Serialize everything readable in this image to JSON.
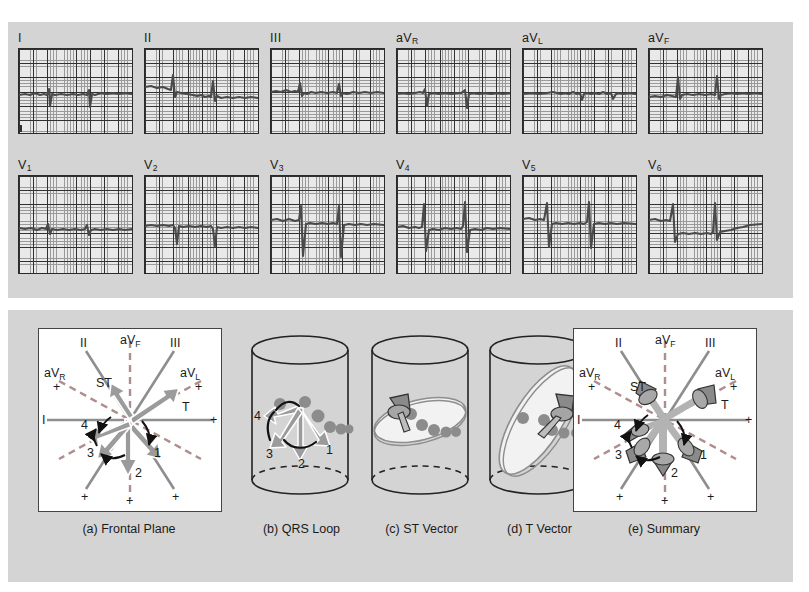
{
  "figure": {
    "background_color": "#d4d4d4",
    "page_color": "#ffffff",
    "trace_color": "#4a4a4a",
    "arrow_fill": "#9b9b9b",
    "grid_fine_color": "#9a9a9a",
    "grid_bold_color": "#313131"
  },
  "ecg": {
    "row1": [
      {
        "name": "I",
        "sub": ""
      },
      {
        "name": "II",
        "sub": ""
      },
      {
        "name": "III",
        "sub": ""
      },
      {
        "name": "aV",
        "sub": "R"
      },
      {
        "name": "aV",
        "sub": "L"
      },
      {
        "name": "aV",
        "sub": "F"
      }
    ],
    "row2": [
      {
        "name": "V",
        "sub": "1"
      },
      {
        "name": "V",
        "sub": "2"
      },
      {
        "name": "V",
        "sub": "3"
      },
      {
        "name": "V",
        "sub": "4"
      },
      {
        "name": "V",
        "sub": "5"
      },
      {
        "name": "V",
        "sub": "6"
      }
    ]
  },
  "vector": {
    "panels": [
      {
        "caption": "(a) Frontal Plane"
      },
      {
        "caption": "(b) QRS Loop"
      },
      {
        "caption": "(c) ST Vector"
      },
      {
        "caption": "(d) T Vector"
      },
      {
        "caption": "(e) Summary"
      }
    ],
    "axes": [
      {
        "label": "I",
        "sub": ""
      },
      {
        "label": "II",
        "sub": ""
      },
      {
        "label": "III",
        "sub": ""
      },
      {
        "label": "aV",
        "sub": "R"
      },
      {
        "label": "aV",
        "sub": "L"
      },
      {
        "label": "aV",
        "sub": "F"
      }
    ],
    "polarity": "+",
    "vector_labels": [
      "ST",
      "T"
    ],
    "loop_numbers": [
      "1",
      "2",
      "3",
      "4"
    ]
  }
}
